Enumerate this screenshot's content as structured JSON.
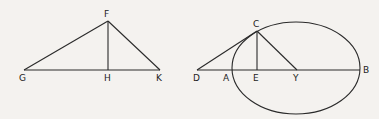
{
  "figure_left": {
    "title": "Triangle GFK with altitude FH",
    "points": {
      "F": {
        "label": "F",
        "x": 108,
        "y": 21
      },
      "G": {
        "label": "G",
        "x": 24,
        "y": 70
      },
      "H": {
        "label": "H",
        "x": 108,
        "y": 70
      },
      "K": {
        "label": "K",
        "x": 160,
        "y": 70
      }
    },
    "segments": [
      [
        "G",
        "F"
      ],
      [
        "F",
        "K"
      ],
      [
        "G",
        "K"
      ],
      [
        "F",
        "H"
      ]
    ]
  },
  "figure_right": {
    "title": "Ellipse with tangent DC, ordinate CE, and line CY",
    "ellipse": {
      "cx": 296,
      "cy": 68,
      "rx": 64,
      "ry": 46
    },
    "points": {
      "C": {
        "label": "C",
        "x": 257,
        "y": 31
      },
      "D": {
        "label": "D",
        "x": 197,
        "y": 70
      },
      "A": {
        "label": "A",
        "x": 232,
        "y": 70
      },
      "E": {
        "label": "E",
        "x": 257,
        "y": 70
      },
      "Y": {
        "label": "Y",
        "x": 297,
        "y": 70
      },
      "B": {
        "label": "B",
        "x": 360,
        "y": 70
      }
    },
    "segments": [
      [
        "D",
        "C"
      ],
      [
        "C",
        "E"
      ],
      [
        "C",
        "Y"
      ],
      [
        "D",
        "B"
      ]
    ]
  },
  "colors": {
    "ink": "#2a2a2a",
    "paper": "#f4f2ef"
  }
}
